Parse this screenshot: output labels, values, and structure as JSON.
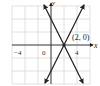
{
  "diagram": {
    "type": "coordinate-graph",
    "axes": {
      "x_label": "x",
      "y_label": "y",
      "x_ticks": [
        {
          "value": -4,
          "label": "−4"
        },
        {
          "value": 0,
          "label": "0"
        },
        {
          "value": 4,
          "label": "4"
        }
      ],
      "x_range": [
        -6,
        6
      ],
      "y_range": [
        -6,
        6
      ],
      "grid_step": 2
    },
    "lines": [
      {
        "name": "line-positive-slope",
        "equation": "y = 2x - 4",
        "slope": 2,
        "intercept": -4
      },
      {
        "name": "line-negative-slope",
        "equation": "y = -2x + 4",
        "slope": -2,
        "intercept": 4
      }
    ],
    "point": {
      "label": "(2, 0)",
      "x": 2,
      "y": 0
    },
    "colors": {
      "grid": "#d8d8d8",
      "axis": "#333333",
      "line": "#222222",
      "background": "#ffffff"
    }
  }
}
